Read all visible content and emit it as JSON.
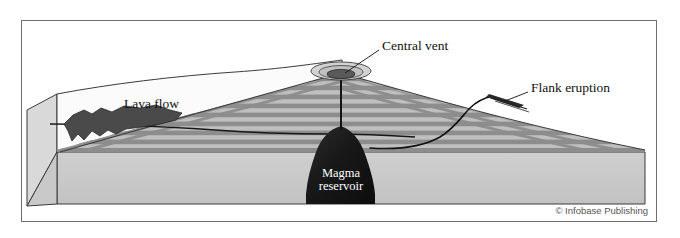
{
  "figure": {
    "kind": "cross-section-block-diagram",
    "frame": {
      "border_color": "#6e6e6e"
    },
    "background_color": "#ffffff"
  },
  "labels": {
    "central_vent": "Central vent",
    "flank_eruption": "Flank eruption",
    "lava_flow": "Lava flow",
    "magma_reservoir_line1": "Magma",
    "magma_reservoir_line2": "reservoir"
  },
  "credit": {
    "text": "© Infobase Publishing"
  },
  "colors": {
    "block_top": "#e9e9e9",
    "block_front": "#c9c9c9",
    "block_left": "#d8d8d8",
    "cone_light": "#bdbdbd",
    "cone_dark": "#8e8e8e",
    "magma": "#1b1b1b",
    "lava_flow": "#4a4a4a",
    "plain_white": "#fbfbfb",
    "outline": "#3b3b3b",
    "conduit": "#151515"
  },
  "parts": [
    {
      "name": "central-vent-crater",
      "description": "elliptical summit crater with concentric rim rings"
    },
    {
      "name": "central-conduit",
      "description": "vertical pipe from crater to magma reservoir"
    },
    {
      "name": "magma-reservoir",
      "description": "dark bulb-shaped chamber beneath the cone"
    },
    {
      "name": "flank-dike",
      "description": "curved conduit branching to the right flank"
    },
    {
      "name": "flank-eruption-vent",
      "description": "fissure on the right flank"
    },
    {
      "name": "lava-flow",
      "description": "dark irregular flow on the left plain"
    },
    {
      "name": "volcano-cone",
      "description": "layered striped composite cone"
    },
    {
      "name": "ground-block",
      "description": "3D cutaway ground block"
    }
  ]
}
